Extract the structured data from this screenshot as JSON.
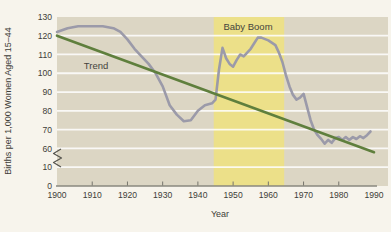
{
  "chart_data": {
    "type": "line",
    "title": "",
    "xlabel": "Year",
    "ylabel": "Births per 1,000 Women Aged 15–44",
    "xlim": [
      1900,
      1990
    ],
    "ylim_display": [
      0,
      130
    ],
    "y_axis_break": {
      "between": [
        10,
        60
      ]
    },
    "grid": "horizontal-white-lines",
    "x_ticks": [
      1900,
      1910,
      1920,
      1930,
      1940,
      1950,
      1960,
      1970,
      1980,
      1990
    ],
    "y_ticks": [
      130,
      120,
      110,
      100,
      90,
      80,
      70,
      60,
      10,
      0
    ],
    "band": {
      "label": "Baby Boom",
      "start_year": 1944.5,
      "end_year": 1964.5,
      "color": "#ece089"
    },
    "annotations": {
      "trend": "Trend"
    },
    "series": [
      {
        "name": "Births per 1,000 women (actual)",
        "color": "#9b9aa9",
        "points": [
          [
            1900,
            122
          ],
          [
            1903,
            124
          ],
          [
            1906,
            125
          ],
          [
            1910,
            125
          ],
          [
            1913,
            125
          ],
          [
            1916,
            124
          ],
          [
            1918,
            122
          ],
          [
            1920,
            118
          ],
          [
            1922,
            113
          ],
          [
            1924,
            109
          ],
          [
            1926,
            105
          ],
          [
            1928,
            100
          ],
          [
            1930,
            93
          ],
          [
            1932,
            83
          ],
          [
            1934,
            78
          ],
          [
            1936,
            74.5
          ],
          [
            1938,
            75
          ],
          [
            1940,
            80
          ],
          [
            1942,
            83
          ],
          [
            1944,
            84
          ],
          [
            1945,
            86
          ],
          [
            1946,
            102
          ],
          [
            1947,
            113.5
          ],
          [
            1948,
            108
          ],
          [
            1949,
            105
          ],
          [
            1950,
            103.5
          ],
          [
            1951,
            107
          ],
          [
            1952,
            110
          ],
          [
            1953,
            109
          ],
          [
            1954,
            111
          ],
          [
            1955,
            113
          ],
          [
            1956,
            116
          ],
          [
            1957,
            119
          ],
          [
            1958,
            119
          ],
          [
            1960,
            117.5
          ],
          [
            1962,
            115
          ],
          [
            1963,
            111
          ],
          [
            1964,
            106
          ],
          [
            1965,
            99
          ],
          [
            1966,
            93
          ],
          [
            1967,
            88.5
          ],
          [
            1968,
            86
          ],
          [
            1969,
            87
          ],
          [
            1970,
            89
          ],
          [
            1971,
            82
          ],
          [
            1972,
            75
          ],
          [
            1973,
            70
          ],
          [
            1974,
            67
          ],
          [
            1975,
            65
          ],
          [
            1976,
            62.5
          ],
          [
            1977,
            64.5
          ],
          [
            1978,
            63
          ],
          [
            1979,
            65.5
          ],
          [
            1980,
            66
          ],
          [
            1981,
            64.5
          ],
          [
            1982,
            66
          ],
          [
            1983,
            64.5
          ],
          [
            1984,
            66
          ],
          [
            1985,
            65
          ],
          [
            1986,
            66.5
          ],
          [
            1987,
            65.5
          ],
          [
            1988,
            67
          ],
          [
            1989,
            69
          ]
        ]
      },
      {
        "name": "Trend",
        "color": "#5f7f3d",
        "points": [
          [
            1900,
            120
          ],
          [
            1990,
            58
          ]
        ]
      }
    ]
  },
  "colors": {
    "page_bg": "#f7f4ec",
    "plot_bg": "#dcd6c4",
    "band": "#ece089",
    "gridline": "#ffffff",
    "births_line": "#9b9aa9",
    "trend_line": "#5f7f3d",
    "axis": "#8a897f",
    "tick": "#76756c",
    "text": "#3e3d38"
  }
}
